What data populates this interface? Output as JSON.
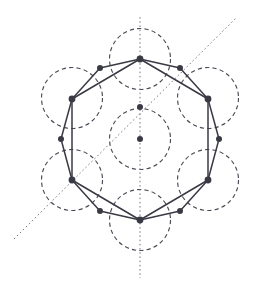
{
  "figure": {
    "canvas": {
      "width": 253,
      "height": 292,
      "background": "#ffffff"
    },
    "colors": {
      "circle_stroke": "#4a4a55",
      "polygon_stroke": "#3a3a45",
      "node_fill": "#3a3a45",
      "axis_stroke": "#7a7a88",
      "background": "#ffffff"
    },
    "strokes": {
      "circle_width": 1.15,
      "circle_dash": "4.2 3.2",
      "polygon_width": 1.5,
      "axis_width": 1.0,
      "axis_dash": "1.6 2.6"
    },
    "circles": {
      "radius": 30.5,
      "centers": [
        {
          "name": "top",
          "cx": 140,
          "cy": 59
        },
        {
          "name": "upper-left",
          "cx": 72,
          "cy": 98
        },
        {
          "name": "upper-right",
          "cx": 208,
          "cy": 98
        },
        {
          "name": "center",
          "cx": 140,
          "cy": 139
        },
        {
          "name": "lower-left",
          "cx": 72,
          "cy": 180
        },
        {
          "name": "lower-right",
          "cx": 208,
          "cy": 180
        },
        {
          "name": "bottom",
          "cx": 140,
          "cy": 220
        }
      ]
    },
    "axes": [
      {
        "name": "vertical-mirror-axis",
        "x1": 140,
        "y1": 17,
        "x2": 140,
        "y2": 278
      },
      {
        "name": "diagonal-mirror-axis",
        "x1": 14,
        "y1": 239,
        "x2": 236,
        "y2": 18
      }
    ],
    "polygon": {
      "name": "dodecagon-outline",
      "closed": true,
      "points": [
        {
          "cx": 140,
          "cy": 59,
          "r": 3.4,
          "label": "v-top"
        },
        {
          "cx": 180,
          "cy": 68,
          "r": 3.0,
          "label": "v-top-right"
        },
        {
          "cx": 208,
          "cy": 99,
          "r": 3.4,
          "label": "v-upper-right"
        },
        {
          "cx": 219,
          "cy": 139,
          "r": 3.0,
          "label": "v-right"
        },
        {
          "cx": 208,
          "cy": 180,
          "r": 3.4,
          "label": "v-lower-right"
        },
        {
          "cx": 180,
          "cy": 211,
          "r": 3.0,
          "label": "v-bottom-right"
        },
        {
          "cx": 140,
          "cy": 220,
          "r": 3.4,
          "label": "v-bottom"
        },
        {
          "cx": 100,
          "cy": 211,
          "r": 3.0,
          "label": "v-bottom-left"
        },
        {
          "cx": 72,
          "cy": 180,
          "r": 3.4,
          "label": "v-lower-left"
        },
        {
          "cx": 61,
          "cy": 139,
          "r": 3.0,
          "label": "v-left"
        },
        {
          "cx": 72,
          "cy": 99,
          "r": 3.4,
          "label": "v-upper-left"
        },
        {
          "cx": 100,
          "cy": 68,
          "r": 3.0,
          "label": "v-top-left"
        }
      ]
    },
    "chords": [
      {
        "name": "chord-top-to-upper-left",
        "x1": 140,
        "y1": 59,
        "x2": 72,
        "y2": 99
      },
      {
        "name": "chord-top-to-upper-right",
        "x1": 140,
        "y1": 59,
        "x2": 208,
        "y2": 99
      },
      {
        "name": "chord-bottom-to-lower-left",
        "x1": 140,
        "y1": 220,
        "x2": 72,
        "y2": 180
      },
      {
        "name": "chord-bottom-to-lower-right",
        "x1": 140,
        "y1": 220,
        "x2": 208,
        "y2": 180
      },
      {
        "name": "chord-upper-left-to-lower-left",
        "x1": 72,
        "y1": 99,
        "x2": 72,
        "y2": 180
      },
      {
        "name": "chord-upper-right-to-lower-right",
        "x1": 208,
        "y1": 99,
        "x2": 208,
        "y2": 180
      }
    ],
    "inner_nodes": [
      {
        "name": "center-node",
        "cx": 140,
        "cy": 139,
        "r": 3.0
      },
      {
        "name": "upper-center-node",
        "cx": 140,
        "cy": 107,
        "r": 3.0
      }
    ]
  }
}
